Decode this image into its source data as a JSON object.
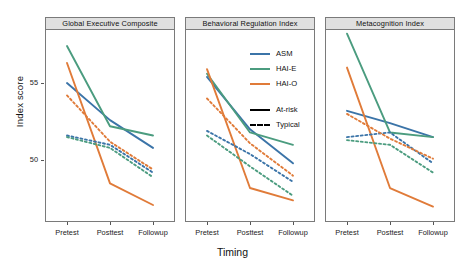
{
  "chart_data": {
    "type": "line",
    "title": "",
    "xlabel": "Timing",
    "ylabel": "Index score",
    "categories": [
      "Pretest",
      "Posttest",
      "Followup"
    ],
    "ylim": [
      46.0,
      58.5
    ],
    "yticks": [
      50,
      55
    ],
    "grid": false,
    "legend_position": "panel-2-top-right",
    "legend": {
      "color_entries": [
        {
          "label": "ASM",
          "color": "#3b74a8"
        },
        {
          "label": "HAI-E",
          "color": "#4b9c7f"
        },
        {
          "label": "HAI-O",
          "color": "#e07b39"
        }
      ],
      "style_entries": [
        {
          "label": "At-risk",
          "style": "solid"
        },
        {
          "label": "Typical",
          "style": "dashed"
        }
      ]
    },
    "panels": [
      {
        "title": "Global Executive Composite",
        "series": [
          {
            "name": "ASM At-risk",
            "color": "#3b74a8",
            "style": "solid",
            "values": [
              55.0,
              52.6,
              50.8
            ]
          },
          {
            "name": "HAI-E At-risk",
            "color": "#4b9c7f",
            "style": "solid",
            "values": [
              57.4,
              52.2,
              51.6
            ]
          },
          {
            "name": "HAI-O At-risk",
            "color": "#e07b39",
            "style": "solid",
            "values": [
              56.3,
              48.5,
              47.1
            ]
          },
          {
            "name": "ASM Typical",
            "color": "#3b74a8",
            "style": "dashed",
            "values": [
              51.6,
              51.0,
              49.2
            ]
          },
          {
            "name": "HAI-E Typical",
            "color": "#4b9c7f",
            "style": "dashed",
            "values": [
              51.5,
              50.8,
              48.9
            ]
          },
          {
            "name": "HAI-O Typical",
            "color": "#e07b39",
            "style": "dashed",
            "values": [
              54.2,
              51.2,
              49.4
            ]
          }
        ]
      },
      {
        "title": "Behavioral Regulation Index",
        "series": [
          {
            "name": "ASM At-risk",
            "color": "#3b74a8",
            "style": "solid",
            "values": [
              55.4,
              52.0,
              49.8
            ]
          },
          {
            "name": "HAI-E At-risk",
            "color": "#4b9c7f",
            "style": "solid",
            "values": [
              55.6,
              51.8,
              51.0
            ]
          },
          {
            "name": "HAI-O At-risk",
            "color": "#e07b39",
            "style": "solid",
            "values": [
              55.9,
              48.2,
              47.4
            ]
          },
          {
            "name": "ASM Typical",
            "color": "#3b74a8",
            "style": "dashed",
            "values": [
              51.9,
              50.4,
              48.6
            ]
          },
          {
            "name": "HAI-E Typical",
            "color": "#4b9c7f",
            "style": "dashed",
            "values": [
              51.6,
              49.6,
              47.7
            ]
          },
          {
            "name": "HAI-O Typical",
            "color": "#e07b39",
            "style": "dashed",
            "values": [
              54.0,
              51.1,
              49.0
            ]
          }
        ]
      },
      {
        "title": "Metacognition Index",
        "series": [
          {
            "name": "ASM At-risk",
            "color": "#3b74a8",
            "style": "solid",
            "values": [
              53.2,
              52.4,
              51.5
            ]
          },
          {
            "name": "HAI-E At-risk",
            "color": "#4b9c7f",
            "style": "solid",
            "values": [
              58.2,
              51.8,
              51.5
            ]
          },
          {
            "name": "HAI-O At-risk",
            "color": "#e07b39",
            "style": "solid",
            "values": [
              56.0,
              48.2,
              47.0
            ]
          },
          {
            "name": "ASM Typical",
            "color": "#3b74a8",
            "style": "dashed",
            "values": [
              51.5,
              51.8,
              49.8
            ]
          },
          {
            "name": "HAI-E Typical",
            "color": "#4b9c7f",
            "style": "dashed",
            "values": [
              51.3,
              51.0,
              49.2
            ]
          },
          {
            "name": "HAI-O Typical",
            "color": "#e07b39",
            "style": "dashed",
            "values": [
              53.0,
              51.4,
              50.1
            ]
          }
        ]
      }
    ]
  }
}
